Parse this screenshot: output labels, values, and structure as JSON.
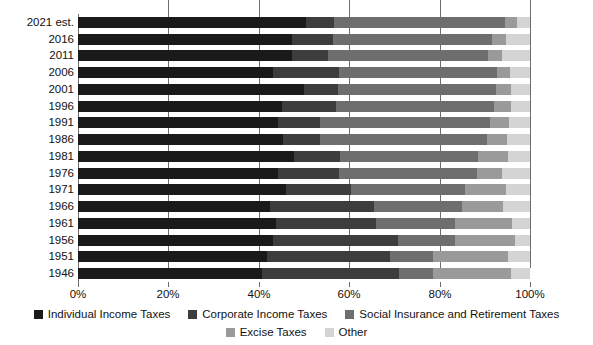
{
  "chart_data": {
    "type": "bar",
    "orientation": "horizontal",
    "stacked": true,
    "normalized": true,
    "title": "",
    "subtitle": "",
    "xlabel": "",
    "ylabel": "",
    "xlim": [
      0,
      100
    ],
    "grid": true,
    "grid_axis": "x",
    "legend_position": "bottom",
    "xticks": [
      "0%",
      "20%",
      "40%",
      "60%",
      "80%",
      "100%"
    ],
    "xtick_values": [
      0,
      20,
      40,
      60,
      80,
      100
    ],
    "categories": [
      "2021 est.",
      "2016",
      "2011",
      "2006",
      "2001",
      "1996",
      "1991",
      "1986",
      "1981",
      "1976",
      "1971",
      "1966",
      "1961",
      "1956",
      "1951",
      "1946"
    ],
    "series": [
      {
        "name": "Individual Income Taxes",
        "color": "#1a1a1a",
        "values": [
          50.5,
          47.3,
          47.4,
          43.1,
          49.9,
          45.2,
          44.3,
          45.4,
          47.7,
          44.2,
          46.1,
          42.4,
          43.8,
          43.2,
          41.8,
          40.6
        ]
      },
      {
        "name": "Corporate Income Taxes",
        "color": "#3d3d3d",
        "values": [
          6.1,
          9.2,
          7.9,
          14.7,
          7.6,
          11.8,
          9.3,
          8.2,
          10.2,
          13.6,
          14.3,
          23.0,
          22.2,
          27.6,
          27.3,
          30.4
        ]
      },
      {
        "name": "Social Insurance and Retirement Taxes",
        "color": "#6e6e6e",
        "values": [
          37.8,
          35.0,
          35.5,
          34.8,
          34.9,
          35.1,
          37.5,
          36.9,
          30.5,
          30.5,
          25.3,
          19.5,
          17.4,
          12.5,
          9.5,
          7.6
        ]
      },
      {
        "name": "Excise Taxes",
        "color": "#9a9a9a",
        "values": [
          2.7,
          3.2,
          3.1,
          2.9,
          3.3,
          3.7,
          4.2,
          4.4,
          6.8,
          5.4,
          8.9,
          9.2,
          12.6,
          13.3,
          16.6,
          17.2
        ]
      },
      {
        "name": "Other",
        "color": "#d4d4d4",
        "values": [
          2.9,
          5.3,
          6.1,
          4.5,
          4.3,
          4.2,
          4.7,
          5.1,
          4.8,
          6.3,
          5.4,
          5.9,
          4.0,
          3.4,
          4.8,
          4.2
        ]
      }
    ]
  },
  "legend": {
    "row1": [
      {
        "label": "Individual Income Taxes",
        "color": "#1a1a1a"
      },
      {
        "label": "Corporate Income Taxes",
        "color": "#3d3d3d"
      },
      {
        "label": "Social Insurance and Retirement Taxes",
        "color": "#6e6e6e"
      }
    ],
    "row2": [
      {
        "label": "Excise Taxes",
        "color": "#9a9a9a"
      },
      {
        "label": "Other",
        "color": "#d4d4d4"
      }
    ]
  },
  "style": {
    "background": "#ffffff",
    "gridline_color": "#6d6d6d",
    "text_color": "#111111"
  }
}
